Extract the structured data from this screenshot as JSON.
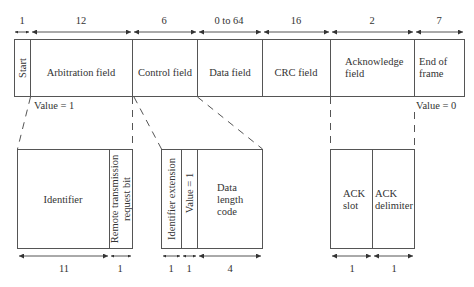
{
  "diagram": {
    "type": "can-data-frame",
    "colors": {
      "line": "#555555",
      "text": "#333333",
      "background": "#ffffff"
    },
    "frame": {
      "fields": [
        {
          "id": "start",
          "label": "Start",
          "bits": "1",
          "vertical": true
        },
        {
          "id": "arbitration",
          "label": "Arbitration field",
          "bits": "12"
        },
        {
          "id": "control",
          "label": "Control field",
          "bits": "6"
        },
        {
          "id": "data",
          "label": "Data field",
          "bits": "0 to 64"
        },
        {
          "id": "crc",
          "label": "CRC field",
          "bits": "16"
        },
        {
          "id": "ack",
          "label_line1": "Acknowledge",
          "label_line2": "field",
          "bits": "2"
        },
        {
          "id": "eof",
          "label_line1": "End of",
          "label_line2": "frame",
          "bits": "7"
        }
      ],
      "annotations": {
        "start_value": "Value = 1",
        "eof_value": "Value = 0"
      }
    },
    "details": {
      "arbitration": {
        "fields": [
          {
            "label": "Identifier",
            "bits": "11"
          },
          {
            "label_line1": "Remote transmission",
            "label_line2": "request bit",
            "bits": "1",
            "vertical": true
          }
        ]
      },
      "control": {
        "fields": [
          {
            "label": "Identifier extension",
            "bits": "1",
            "vertical": true
          },
          {
            "label": "Value = 1",
            "bits": "1",
            "vertical": true
          },
          {
            "label_line1": "Data",
            "label_line2": "length",
            "label_line3": "code",
            "bits": "4"
          }
        ]
      },
      "ack": {
        "fields": [
          {
            "label_line1": "ACK",
            "label_line2": "slot",
            "bits": "1"
          },
          {
            "label_line1": "ACK",
            "label_line2": "delimiter",
            "bits": "1"
          }
        ]
      }
    }
  }
}
